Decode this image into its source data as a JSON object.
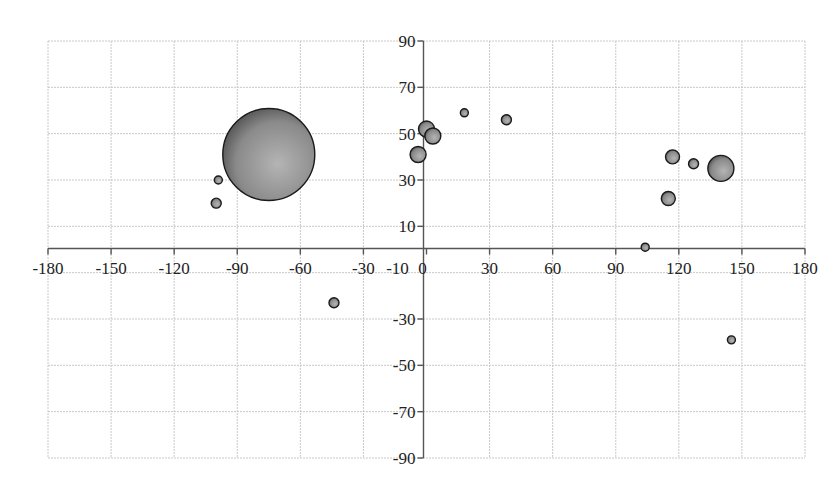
{
  "chart_data": {
    "type": "scatter",
    "subtype": "bubble",
    "title": "",
    "xlabel": "",
    "ylabel": "",
    "xlim": [
      -180,
      180
    ],
    "ylim": [
      -90,
      90
    ],
    "x_ticks": [
      -180,
      -150,
      -120,
      -90,
      -60,
      -30,
      -10,
      0,
      30,
      60,
      90,
      120,
      150,
      180
    ],
    "y_ticks": [
      90,
      70,
      50,
      30,
      10,
      -30,
      -50,
      -70,
      -90
    ],
    "grid": true,
    "legend": null,
    "series": [
      {
        "name": "bubbles",
        "points": [
          {
            "x": -75,
            "y": 41,
            "r": 46
          },
          {
            "x": -99,
            "y": 30,
            "r": 4
          },
          {
            "x": -100,
            "y": 20,
            "r": 5
          },
          {
            "x": 0,
            "y": 52,
            "r": 8
          },
          {
            "x": 3,
            "y": 49,
            "r": 8
          },
          {
            "x": -4,
            "y": 41,
            "r": 8
          },
          {
            "x": 18,
            "y": 59,
            "r": 4
          },
          {
            "x": 38,
            "y": 56,
            "r": 5
          },
          {
            "x": 117,
            "y": 40,
            "r": 7
          },
          {
            "x": 127,
            "y": 37,
            "r": 5
          },
          {
            "x": 140,
            "y": 35,
            "r": 13
          },
          {
            "x": 115,
            "y": 22,
            "r": 7
          },
          {
            "x": 104,
            "y": 1,
            "r": 4
          },
          {
            "x": -44,
            "y": -23,
            "r": 5
          },
          {
            "x": 145,
            "y": -39,
            "r": 4
          }
        ]
      }
    ]
  },
  "colors": {
    "bubble_fill_light": "#b4b4b4",
    "bubble_fill_dark": "#555555",
    "bubble_stroke": "#1a1a1a",
    "grid": "#c8c8c8",
    "axis": "#555555",
    "text": "#222222"
  }
}
